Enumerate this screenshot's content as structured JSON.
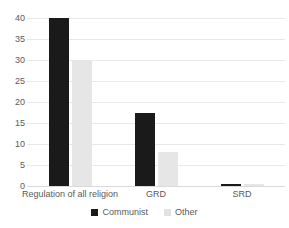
{
  "chart_data": {
    "type": "bar",
    "title": "",
    "subtitle": "",
    "xlabel": "",
    "ylabel": "",
    "categories": [
      "Regulation of all religion",
      "GRD",
      "SRD"
    ],
    "series": [
      {
        "name": "Communist",
        "color": "#1a1a1a",
        "values": [
          40,
          17.3,
          0.5
        ]
      },
      {
        "name": "Other",
        "color": "#e6e6e6",
        "values": [
          29.8,
          8,
          0.5
        ]
      }
    ],
    "ylim": [
      0,
      40
    ],
    "yticks": [
      0,
      5,
      10,
      15,
      20,
      25,
      30,
      35,
      40
    ],
    "ytick_labels": [
      "0",
      "5",
      "10",
      "15",
      "20",
      "25",
      "30",
      "35",
      "40"
    ],
    "grid": "horizontal",
    "legend_position": "bottom",
    "annotations": []
  },
  "axis": {
    "y_tick_labels": [
      "40",
      "35",
      "30",
      "25",
      "20",
      "15",
      "10",
      "5",
      "0"
    ],
    "x_tick_labels": [
      "Regulation of all religion",
      "GRD",
      "SRD"
    ]
  },
  "legend": {
    "entries": [
      {
        "label": "Communist",
        "swatch": "legend-swatch-communist"
      },
      {
        "label": "Other",
        "swatch": "legend-swatch-other"
      }
    ]
  },
  "colors": {
    "communist": "#1a1a1a",
    "other": "#e6e6e6",
    "gridline": "#e8e8e8",
    "text": "#5a5a5a",
    "background": "#ffffff"
  }
}
